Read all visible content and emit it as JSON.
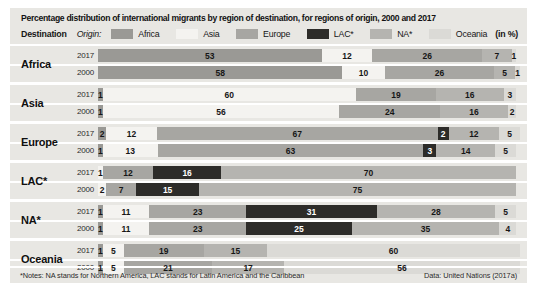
{
  "title": "Percentage distribution of international migrants by region of destination, for regions of origin, 2000 and 2017",
  "header": {
    "destination_label": "Destination",
    "origin_label": "Origin:",
    "unit_label": "(in %)"
  },
  "legend": [
    {
      "label": "Africa",
      "color": "#9a9995"
    },
    {
      "label": "Asia",
      "color": "#f4f3f0"
    },
    {
      "label": "Europe",
      "color": "#a7a6a2"
    },
    {
      "label": "LAC*",
      "color": "#2d2c29"
    },
    {
      "label": "NA*",
      "color": "#b5b4b0"
    },
    {
      "label": "Oceania",
      "color": "#dbdad6"
    }
  ],
  "colors": {
    "Africa": "#9a9995",
    "Asia": "#f4f3f0",
    "Europe": "#a7a6a2",
    "LAC*": "#2d2c29",
    "NA*": "#b5b4b0",
    "Oceania": "#dbdad6",
    "panel_background": "#e8e7e3",
    "separator": "#ffffff"
  },
  "footer": {
    "notes": "*Notes: NA stands for Northern America, LAC stands for Latin America and the Caribbean",
    "source": "Data: United Nations (2017a)"
  },
  "chart_data": {
    "type": "bar",
    "stacked": true,
    "orientation": "horizontal",
    "unit": "%",
    "xlim": [
      0,
      100
    ],
    "title": "Percentage distribution of international migrants by region of destination, for regions of origin, 2000 and 2017",
    "legend": [
      "Africa",
      "Asia",
      "Europe",
      "LAC*",
      "NA*",
      "Oceania"
    ],
    "groups": [
      {
        "label": "Africa",
        "rows": [
          {
            "year": "2017",
            "segments": [
              [
                "Africa",
                53
              ],
              [
                "Asia",
                12
              ],
              [
                "Europe",
                26
              ],
              [
                "NA*",
                7
              ],
              [
                "Oceania",
                1
              ]
            ]
          },
          {
            "year": "2000",
            "segments": [
              [
                "Africa",
                58
              ],
              [
                "Asia",
                10
              ],
              [
                "Europe",
                26
              ],
              [
                "NA*",
                5
              ],
              [
                "Oceania",
                1
              ]
            ]
          }
        ]
      },
      {
        "label": "Asia",
        "rows": [
          {
            "year": "2017",
            "segments": [
              [
                "Africa",
                1
              ],
              [
                "Asia",
                60
              ],
              [
                "Europe",
                19
              ],
              [
                "NA*",
                16
              ],
              [
                "Oceania",
                3
              ]
            ]
          },
          {
            "year": "2000",
            "segments": [
              [
                "Africa",
                1
              ],
              [
                "Asia",
                56
              ],
              [
                "Europe",
                24
              ],
              [
                "NA*",
                16
              ],
              [
                "Oceania",
                2
              ]
            ]
          }
        ]
      },
      {
        "label": "Europe",
        "rows": [
          {
            "year": "2017",
            "segments": [
              [
                "Africa",
                2
              ],
              [
                "Asia",
                12
              ],
              [
                "Europe",
                67
              ],
              [
                "LAC*",
                2
              ],
              [
                "NA*",
                12
              ],
              [
                "Oceania",
                5
              ]
            ]
          },
          {
            "year": "2000",
            "segments": [
              [
                "Africa",
                1
              ],
              [
                "Asia",
                13
              ],
              [
                "Europe",
                63
              ],
              [
                "LAC*",
                3
              ],
              [
                "NA*",
                14
              ],
              [
                "Oceania",
                5
              ]
            ]
          }
        ]
      },
      {
        "label": "LAC*",
        "rows": [
          {
            "year": "2017",
            "segments": [
              [
                "Asia",
                1
              ],
              [
                "Europe",
                12
              ],
              [
                "LAC*",
                16
              ],
              [
                "NA*",
                70
              ]
            ]
          },
          {
            "year": "2000",
            "segments": [
              [
                "Asia",
                2
              ],
              [
                "Europe",
                7
              ],
              [
                "LAC*",
                15
              ],
              [
                "NA*",
                75
              ]
            ]
          }
        ]
      },
      {
        "label": "NA*",
        "rows": [
          {
            "year": "2017",
            "segments": [
              [
                "Africa",
                1
              ],
              [
                "Asia",
                11
              ],
              [
                "Europe",
                23
              ],
              [
                "LAC*",
                31
              ],
              [
                "NA*",
                28
              ],
              [
                "Oceania",
                5
              ]
            ]
          },
          {
            "year": "2000",
            "segments": [
              [
                "Africa",
                1
              ],
              [
                "Asia",
                11
              ],
              [
                "Europe",
                23
              ],
              [
                "LAC*",
                25
              ],
              [
                "NA*",
                35
              ],
              [
                "Oceania",
                4
              ]
            ]
          }
        ]
      },
      {
        "label": "Oceania",
        "rows": [
          {
            "year": "2017",
            "segments": [
              [
                "Africa",
                1
              ],
              [
                "Asia",
                5
              ],
              [
                "Europe",
                19
              ],
              [
                "NA*",
                15
              ],
              [
                "Oceania",
                60
              ]
            ]
          },
          {
            "year": "2000",
            "segments": [
              [
                "Africa",
                1
              ],
              [
                "Asia",
                5
              ],
              [
                "Europe",
                21
              ],
              [
                "NA*",
                17
              ],
              [
                "Oceania",
                56
              ]
            ]
          }
        ]
      }
    ]
  }
}
